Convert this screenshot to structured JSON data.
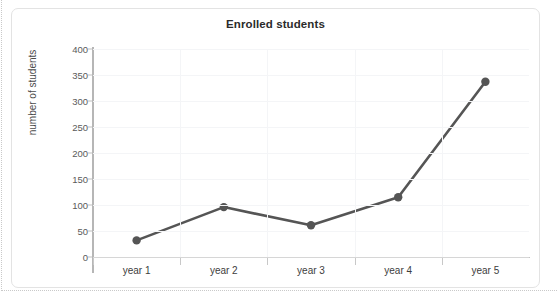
{
  "ghost_text": "",
  "chart_data": {
    "type": "line",
    "title": "Enrolled students",
    "xlabel": "",
    "ylabel": "number of students",
    "categories": [
      "year 1",
      "year 2",
      "year 3",
      "year 4",
      "year 5"
    ],
    "values": [
      32,
      96,
      61,
      115,
      337
    ],
    "series": [
      {
        "name": "Enrolled students",
        "values": [
          32,
          96,
          61,
          115,
          337
        ]
      }
    ],
    "ylim": [
      0,
      400
    ],
    "ytick_labels": [
      "400",
      "350",
      "300",
      "250",
      "200",
      "150",
      "100",
      "50",
      "0"
    ],
    "ytick_values": [
      400,
      350,
      300,
      250,
      200,
      150,
      100,
      50,
      0
    ],
    "ytick_step": 50,
    "grid": true,
    "legend": "none",
    "line_color": "#555555",
    "marker_color": "#555555",
    "marker": "circle",
    "axis_color": "#b6b6b6",
    "grid_color": "#f4f5f7",
    "background": "#ffffff"
  }
}
